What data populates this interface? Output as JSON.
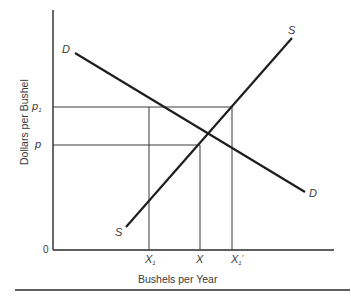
{
  "diagram": {
    "type": "supply-demand",
    "y_axis_label": "Dollars per Bushel",
    "x_axis_label": "Bushels per Year",
    "origin_label": "0",
    "price_labels": {
      "p1": {
        "main": "p",
        "sub": "1"
      },
      "p": {
        "main": "p"
      }
    },
    "quantity_labels": {
      "x1": {
        "main": "X",
        "sub": "1"
      },
      "x": {
        "main": "X"
      },
      "x1_prime": {
        "main": "X",
        "sub": "1",
        "prime": "′"
      }
    },
    "curves": {
      "demand": {
        "label_start": "D",
        "label_end": "D"
      },
      "supply": {
        "label_start": "S",
        "label_end": "S"
      }
    },
    "colors": {
      "line": "#1e1e1e",
      "guide": "#3a3a3a",
      "text": "#3a3a3a"
    }
  }
}
